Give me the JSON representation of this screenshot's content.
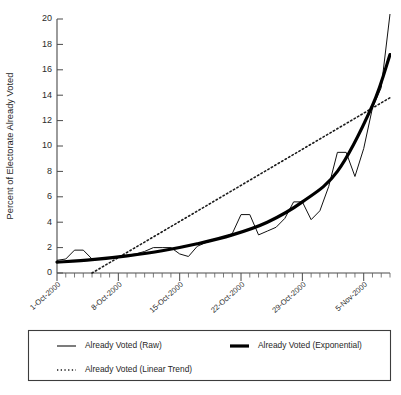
{
  "chart_data": {
    "type": "line",
    "title": "",
    "xlabel": "",
    "ylabel": "Percent of Electorate Already Voted",
    "ylim": [
      0,
      20
    ],
    "yticks": [
      0,
      2,
      4,
      6,
      8,
      10,
      12,
      14,
      16,
      18,
      20
    ],
    "ytick_labels": [
      "0",
      "2",
      "4",
      "6",
      "8",
      "10",
      "12",
      "14",
      "16",
      "18",
      "20"
    ],
    "xlim": [
      "1-Oct-2000",
      "8-Nov-2000"
    ],
    "xticks": [
      "1-Oct-2000",
      "8-Oct-2000",
      "15-Oct-2000",
      "22-Oct-2000",
      "29-Oct-2000",
      "5-Nov-2000"
    ],
    "xtick_labels": [
      "1-Oct-2000",
      "8-Oct-2000",
      "15-Oct-2000",
      "22-Oct-2000",
      "29-Oct-2000",
      "5-Nov-2000"
    ],
    "x_minor_tick_interval_days": 1,
    "x_major_tick_interval_days": 7,
    "grid": false,
    "legend_position": "below-plot",
    "series": [
      {
        "name": "Already Voted (Raw)",
        "style": "thin-solid",
        "color": "#111111",
        "x_days": [
          0,
          1,
          2,
          3,
          4,
          5,
          6,
          7,
          8,
          9,
          10,
          11,
          12,
          13,
          14,
          15,
          16,
          17,
          18,
          19,
          20,
          21,
          22,
          23,
          24,
          25,
          26,
          27,
          28,
          29,
          30,
          31,
          32,
          33,
          34,
          35,
          36,
          37,
          38
        ],
        "values": [
          1.0,
          1.1,
          1.8,
          1.8,
          1.1,
          1.1,
          1.2,
          1.3,
          1.4,
          1.5,
          1.7,
          2.0,
          2.0,
          2.0,
          1.5,
          1.3,
          2.1,
          2.4,
          2.6,
          2.8,
          3.1,
          4.6,
          4.6,
          3.0,
          3.3,
          3.6,
          4.3,
          5.6,
          5.6,
          4.2,
          4.9,
          6.8,
          9.5,
          9.5,
          7.6,
          9.8,
          13.0,
          14.6,
          20.4
        ]
      },
      {
        "name": "Already Voted (Exponential)",
        "style": "thick-solid",
        "color": "#000000",
        "x_days": [
          0,
          4,
          8,
          12,
          16,
          20,
          24,
          28,
          32,
          36,
          38
        ],
        "values": [
          0.85,
          1.05,
          1.35,
          1.75,
          2.3,
          3.0,
          4.0,
          5.6,
          8.0,
          13.2,
          17.2
        ]
      },
      {
        "name": "Already Voted (Linear Trend)",
        "style": "dotted",
        "color": "#1a1a1a",
        "x_days": [
          4.0,
          38
        ],
        "values": [
          0.0,
          13.8
        ]
      }
    ]
  },
  "legend": {
    "entries": [
      {
        "label": "Already Voted (Raw)",
        "style": "thin-solid"
      },
      {
        "label": "Already Voted (Exponential)",
        "style": "thick-solid"
      },
      {
        "label": "Already Voted (Linear Trend)",
        "style": "dotted"
      }
    ]
  },
  "colors": {
    "background": "#ffffff",
    "axis": "#4a4a4a",
    "text": "#1f1f1f",
    "series_raw": "#111111",
    "series_exponential": "#000000",
    "series_linear": "#1a1a1a"
  }
}
